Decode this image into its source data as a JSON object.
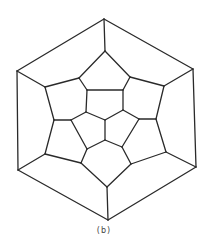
{
  "caption": "(b)",
  "diagram": {
    "type": "planar-graph",
    "stroke_color": "#2a2a2a",
    "background": "#ffffff",
    "vertices": {
      "o1": [
        104,
        19
      ],
      "o2": [
        193,
        69
      ],
      "o3": [
        196,
        167
      ],
      "o4": [
        108,
        220
      ],
      "o5": [
        18,
        170
      ],
      "o6": [
        17,
        71
      ],
      "m1": [
        105,
        51
      ],
      "m2": [
        164,
        86
      ],
      "m3": [
        166,
        152
      ],
      "m4": [
        107,
        187
      ],
      "m5": [
        45,
        154
      ],
      "m6": [
        45,
        87
      ],
      "a1": [
        79,
        78
      ],
      "a2": [
        130,
        77
      ],
      "b1": [
        54,
        120
      ],
      "b2": [
        156,
        119
      ],
      "c1": [
        81,
        163
      ],
      "c2": [
        131,
        164
      ],
      "i1": [
        87,
        90
      ],
      "i2": [
        123,
        90
      ],
      "i3": [
        123,
        110
      ],
      "i4": [
        105,
        120
      ],
      "i5": [
        86,
        112
      ],
      "j1": [
        71,
        120
      ],
      "j2": [
        139,
        119
      ],
      "j3": [
        87,
        149
      ],
      "j4": [
        122,
        147
      ],
      "j5": [
        105,
        140
      ]
    },
    "edges": [
      [
        "o1",
        "o2"
      ],
      [
        "o2",
        "o3"
      ],
      [
        "o3",
        "o4"
      ],
      [
        "o4",
        "o5"
      ],
      [
        "o5",
        "o6"
      ],
      [
        "o6",
        "o1"
      ],
      [
        "o1",
        "m1"
      ],
      [
        "o2",
        "m2"
      ],
      [
        "o3",
        "m3"
      ],
      [
        "o4",
        "m4"
      ],
      [
        "o5",
        "m5"
      ],
      [
        "o6",
        "m6"
      ],
      [
        "m1",
        "a1"
      ],
      [
        "a1",
        "m6"
      ],
      [
        "m1",
        "a2"
      ],
      [
        "a2",
        "m2"
      ],
      [
        "m6",
        "b1"
      ],
      [
        "b1",
        "m5"
      ],
      [
        "m2",
        "b2"
      ],
      [
        "b2",
        "m3"
      ],
      [
        "m5",
        "c1"
      ],
      [
        "c1",
        "m4"
      ],
      [
        "m4",
        "c2"
      ],
      [
        "c2",
        "m3"
      ],
      [
        "a1",
        "i1"
      ],
      [
        "a2",
        "i2"
      ],
      [
        "i1",
        "i2"
      ],
      [
        "i2",
        "i3"
      ],
      [
        "i3",
        "i4"
      ],
      [
        "i4",
        "i5"
      ],
      [
        "i5",
        "i1"
      ],
      [
        "b1",
        "j1"
      ],
      [
        "j1",
        "i5"
      ],
      [
        "b2",
        "j2"
      ],
      [
        "j2",
        "i3"
      ],
      [
        "c1",
        "j3"
      ],
      [
        "j3",
        "j1"
      ],
      [
        "c2",
        "j4"
      ],
      [
        "j4",
        "j2"
      ],
      [
        "j3",
        "j5"
      ],
      [
        "j5",
        "j4"
      ],
      [
        "j5",
        "i4"
      ]
    ]
  }
}
